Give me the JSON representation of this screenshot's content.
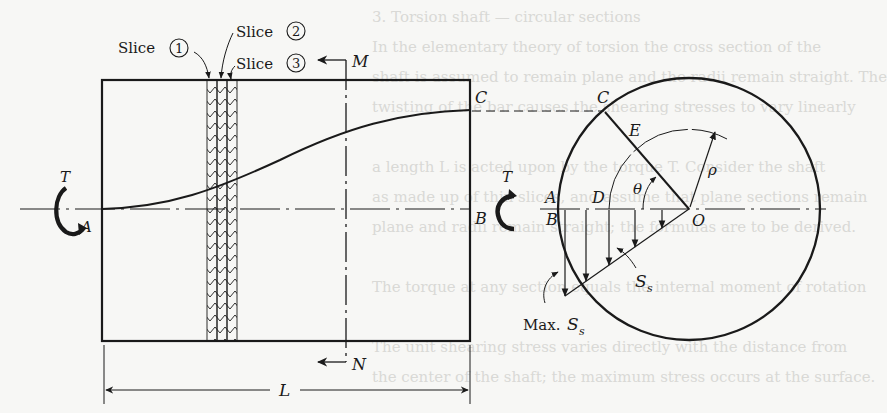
{
  "figure": {
    "bleed_through_text": [
      "3. Torsion shaft — circular sections",
      "In the elementary theory of torsion the cross section of the",
      "shaft is assumed to remain plane and the radii remain straight. The",
      "twisting of the bar causes the shearing stresses to vary linearly",
      "",
      "a length L is acted upon by the torque T. Consider the shaft",
      "as made up of thin slices, and assume that plane sections remain",
      "plane and radii remain straight; the formulas are to be derived.",
      "",
      "The torque at any section equals the internal moment of rotation",
      "",
      "The unit shearing stress varies directly with the distance from",
      "the center of the shaft; the maximum stress occurs at the surface."
    ],
    "labels": {
      "slice1": "Slice",
      "slice1_num": "1",
      "slice2": "Slice",
      "slice2_num": "2",
      "slice3": "Slice",
      "slice3_num": "3",
      "M": "M",
      "N": "N",
      "C_shaft": "C",
      "C_section": "C",
      "E": "E",
      "T_left": "T",
      "A_left": "A",
      "T_right": "T",
      "B_shaft": "B",
      "A_section": "A",
      "B_section": "B",
      "D": "D",
      "theta": "θ",
      "rho": "ρ",
      "O": "O",
      "Ss": "S",
      "Ss_sub": "s",
      "max_Ss_prefix": "Max.",
      "max_Ss": "S",
      "max_Ss_sub": "s",
      "L": "L"
    },
    "colors": {
      "ink": "#1a1a1a",
      "paper": "#f7f7f5",
      "bleed": "#d9d9d6"
    }
  }
}
